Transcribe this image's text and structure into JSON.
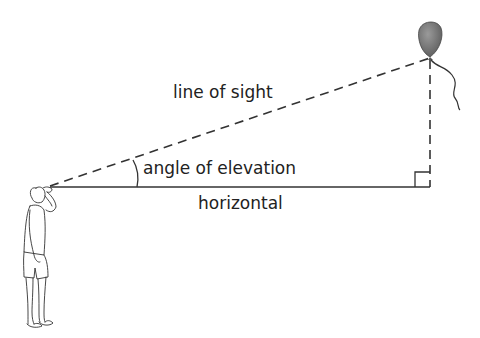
{
  "diagram": {
    "labels": {
      "line_of_sight": "line of sight",
      "angle_of_elevation": "angle of elevation",
      "horizontal": "horizontal"
    },
    "elements": {
      "observer": "person-looking-up",
      "object": "balloon",
      "right_angle": "right-angle-marker"
    },
    "colors": {
      "line": "#333333",
      "balloon": "#777777"
    }
  }
}
